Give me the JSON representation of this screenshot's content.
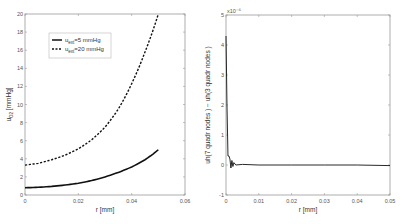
{
  "chart_data": [
    {
      "type": "line",
      "title": "",
      "xlabel": "r [mm]",
      "ylabel": "u_O2 [mmHg]",
      "xlim": [
        0,
        0.06
      ],
      "ylim": [
        0,
        20
      ],
      "x_ticks": [
        "0",
        "0.02",
        "0.04",
        "0.06"
      ],
      "y_ticks": [
        "0",
        "2",
        "4",
        "6",
        "8",
        "10",
        "12",
        "14",
        "16",
        "18",
        "20"
      ],
      "grid": false,
      "legend_position": "upper left",
      "x": [
        0,
        0.005,
        0.01,
        0.015,
        0.02,
        0.025,
        0.03,
        0.035,
        0.04,
        0.045,
        0.05
      ],
      "series": [
        {
          "name": "u_ext=5 mmHg",
          "style": "solid",
          "values": [
            0.8,
            0.85,
            0.95,
            1.1,
            1.3,
            1.6,
            2.0,
            2.5,
            3.1,
            3.9,
            5.0
          ]
        },
        {
          "name": "u_ext=20 mmHg",
          "style": "dashed",
          "values": [
            3.3,
            3.5,
            3.9,
            4.4,
            5.1,
            6.1,
            7.5,
            9.5,
            12.3,
            15.8,
            20.0
          ]
        }
      ]
    },
    {
      "type": "line",
      "title": "",
      "xlabel": "r [mm]",
      "ylabel": "uh(7 quadr nodes ) − uh(3 quadr nodes )",
      "y_multiplier": "x10⁻⁶",
      "xlim": [
        0,
        0.05
      ],
      "ylim": [
        -1,
        5
      ],
      "x_ticks": [
        "0",
        "0.01",
        "0.02",
        "0.03",
        "0.04",
        "0.05"
      ],
      "y_ticks": [
        "-1",
        "0",
        "1",
        "2",
        "3",
        "4",
        "5"
      ],
      "grid": false,
      "x": [
        0,
        0.0003,
        0.0006,
        0.0009,
        0.0012,
        0.0015,
        0.0018,
        0.0021,
        0.0024,
        0.003,
        0.005,
        0.01,
        0.02,
        0.03,
        0.04,
        0.05
      ],
      "series": [
        {
          "name": "difference",
          "style": "solid",
          "values": [
            4.3,
            2.0,
            0.3,
            0.3,
            0.2,
            -0.1,
            0.15,
            -0.05,
            0.08,
            0.0,
            0.02,
            0.0,
            0.0,
            0.0,
            0.0,
            -0.02
          ]
        }
      ]
    }
  ]
}
